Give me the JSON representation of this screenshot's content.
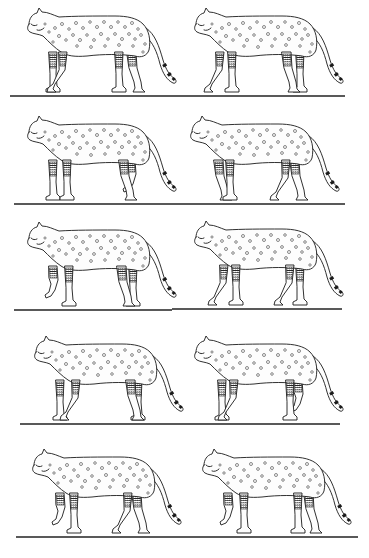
{
  "figure": {
    "rows": 5,
    "columns": 2,
    "colors": {
      "ink": "#1a1a1a",
      "background": "#ffffff"
    },
    "frames": [
      {
        "index": 1,
        "row": 1,
        "col": 1,
        "pose": "walk-a",
        "x": 15,
        "ground_y": 96
      },
      {
        "index": 2,
        "row": 1,
        "col": 2,
        "pose": "walk-b",
        "x": 182,
        "ground_y": 96
      },
      {
        "index": 3,
        "row": 2,
        "col": 1,
        "pose": "walk-c",
        "x": 15,
        "ground_y": 204
      },
      {
        "index": 4,
        "row": 2,
        "col": 2,
        "pose": "walk-d",
        "x": 178,
        "ground_y": 204
      },
      {
        "index": 5,
        "row": 3,
        "col": 1,
        "pose": "walk-e",
        "x": 15,
        "ground_y": 310
      },
      {
        "index": 6,
        "row": 3,
        "col": 2,
        "pose": "walk-f",
        "x": 182,
        "ground_y": 310
      },
      {
        "index": 7,
        "row": 4,
        "col": 1,
        "pose": "walk-g",
        "x": 22,
        "ground_y": 424
      },
      {
        "index": 8,
        "row": 4,
        "col": 2,
        "pose": "walk-h",
        "x": 182,
        "ground_y": 424
      },
      {
        "index": 9,
        "row": 5,
        "col": 1,
        "pose": "walk-i",
        "x": 20,
        "ground_y": 537
      },
      {
        "index": 10,
        "row": 5,
        "col": 2,
        "pose": "walk-j",
        "x": 190,
        "ground_y": 537
      }
    ],
    "ground_lines": [
      {
        "row": 1,
        "x1": 10,
        "x2": 345,
        "y": 96
      },
      {
        "row": 2,
        "x1": 14,
        "x2": 345,
        "y": 204
      },
      {
        "row": 3,
        "x1": 14,
        "x2": 172,
        "y": 310
      },
      {
        "row": 3,
        "x1": 172,
        "x2": 342,
        "y": 309
      },
      {
        "row": 4,
        "x1": 20,
        "x2": 340,
        "y": 424
      },
      {
        "row": 5,
        "x1": 16,
        "x2": 358,
        "y": 537
      }
    ]
  }
}
